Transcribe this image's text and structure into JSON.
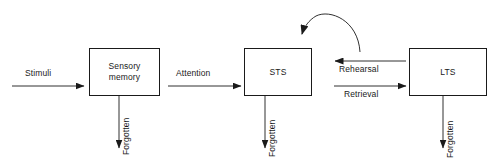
{
  "diagram": {
    "background_color": "#ffffff",
    "line_color": "#1a1a1a",
    "text_color": "#1a1a1a",
    "nodes": [
      {
        "id": "sensory-memory",
        "label": "Sensory\nmemory",
        "x": 89,
        "y": 48,
        "w": 71,
        "h": 48
      },
      {
        "id": "sts",
        "label": "STS",
        "x": 244,
        "y": 48,
        "w": 68,
        "h": 48
      },
      {
        "id": "lts",
        "label": "LTS",
        "x": 409,
        "y": 48,
        "w": 78,
        "h": 48
      }
    ],
    "edges": [
      {
        "id": "stimuli",
        "label": "Stimuli",
        "from": "",
        "to": "sensory-memory",
        "direction": "right",
        "x1": 12,
        "y1": 86,
        "x2": 85,
        "y2": 86
      },
      {
        "id": "attention",
        "label": "Attention",
        "from": "sensory-memory",
        "to": "sts",
        "direction": "right",
        "x1": 168,
        "y1": 86,
        "x2": 242,
        "y2": 86
      },
      {
        "id": "rehearsal",
        "label": "Rehearsal",
        "from": "lts",
        "to": "sts",
        "direction": "left",
        "x1": 407,
        "y1": 61,
        "x2": 334,
        "y2": 61
      },
      {
        "id": "retrieval",
        "label": "Retrieval",
        "from": "sts",
        "to": "lts",
        "direction": "right",
        "x1": 334,
        "y1": 86,
        "x2": 407,
        "y2": 86
      },
      {
        "id": "rehearsal-loop",
        "label": "",
        "from": "sts",
        "to": "sts",
        "direction": "curved-left",
        "x1": 360,
        "y1": 50,
        "x2": 301,
        "y2": 34
      },
      {
        "id": "forgotten-sensory",
        "label": "Forgotten",
        "from": "sensory-memory",
        "to": "",
        "direction": "down",
        "x1": 119,
        "y1": 96,
        "x2": 119,
        "y2": 150
      },
      {
        "id": "forgotten-sts",
        "label": "Forgotten",
        "from": "sts",
        "to": "",
        "direction": "down",
        "x1": 265,
        "y1": 96,
        "x2": 265,
        "y2": 150
      },
      {
        "id": "forgotten-lts",
        "label": "Forgotten",
        "from": "lts",
        "to": "",
        "direction": "down",
        "x1": 443,
        "y1": 96,
        "x2": 443,
        "y2": 150
      }
    ],
    "labels": {
      "stimuli": "Stimuli",
      "attention": "Attention",
      "rehearsal": "Rehearsal",
      "retrieval": "Retrieval",
      "forgotten_sensory": "Forgotten",
      "forgotten_sts": "Forgotten",
      "forgotten_lts": "Forgotten",
      "sensory_memory": "Sensory\nmemory",
      "sts": "STS",
      "lts": "LTS"
    }
  }
}
